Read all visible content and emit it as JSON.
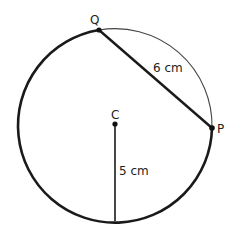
{
  "diagram": {
    "points": {
      "Q": {
        "label": "Q"
      },
      "P": {
        "label": "P"
      },
      "C": {
        "label": "C"
      }
    },
    "chord_label": "6 cm",
    "radius_label": "5 cm",
    "colors": {
      "stroke": "#1a1a1a",
      "background": "#ffffff"
    }
  }
}
